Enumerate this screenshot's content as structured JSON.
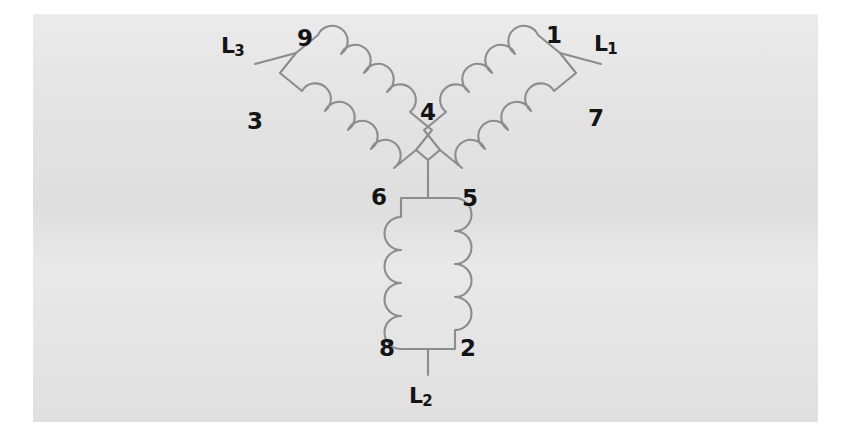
{
  "figure": {
    "kind": "wye-connected-three-phase-motor-winding-diagram",
    "panel_background": "#e2e2e2",
    "page_background": "#ffffff",
    "line_color": "#8c8c8c",
    "label_color": "#141414"
  },
  "terminals": [
    {
      "id": "L1",
      "text": "L",
      "sub": "1",
      "x": 594,
      "y": 33,
      "coil": "right"
    },
    {
      "id": "L2",
      "text": "L",
      "sub": "2",
      "x": 409,
      "y": 385,
      "coil": "bottom"
    },
    {
      "id": "L3",
      "text": "L",
      "sub": "3",
      "x": 221,
      "y": 35,
      "coil": "left"
    }
  ],
  "nodes": [
    {
      "id": "1",
      "label": "1",
      "x": 546,
      "y": 24,
      "coil": "right",
      "end": "outer-top"
    },
    {
      "id": "7",
      "label": "7",
      "x": 588,
      "y": 107,
      "coil": "right",
      "end": "outer-bottom"
    },
    {
      "id": "4",
      "label": "4",
      "x": 420,
      "y": 101,
      "coil": "right",
      "end": "inner-star"
    },
    {
      "id": "9",
      "label": "9",
      "x": 297,
      "y": 27,
      "coil": "left",
      "end": "outer-top"
    },
    {
      "id": "3",
      "label": "3",
      "x": 247,
      "y": 110,
      "coil": "left",
      "end": "outer-bottom"
    },
    {
      "id": "6",
      "label": "6",
      "x": 371,
      "y": 186,
      "coil": "left",
      "end": "inner-star"
    },
    {
      "id": "5",
      "label": "5",
      "x": 462,
      "y": 187,
      "coil": "bottom",
      "end": "top-star"
    },
    {
      "id": "8",
      "label": "8",
      "x": 379,
      "y": 337,
      "coil": "bottom",
      "end": "bottom-outer"
    },
    {
      "id": "2",
      "label": "2",
      "x": 460,
      "y": 337,
      "coil": "bottom",
      "end": "bottom-outer"
    }
  ],
  "coils": [
    {
      "id": "coil-left",
      "phase": "L3",
      "bumps_per_side": 4,
      "leads": [
        "9",
        "3"
      ],
      "star_node": "6"
    },
    {
      "id": "coil-right",
      "phase": "L1",
      "bumps_per_side": 4,
      "leads": [
        "1",
        "7"
      ],
      "star_node": "4"
    },
    {
      "id": "coil-bottom",
      "phase": "L2",
      "bumps_per_side": 4,
      "leads": [
        "8",
        "2"
      ],
      "star_node": "5"
    }
  ],
  "star_point": {
    "x": 428,
    "y": 160,
    "connects": [
      "4",
      "6",
      "5"
    ]
  }
}
